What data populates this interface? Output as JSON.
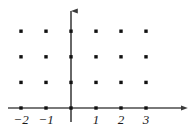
{
  "figure": {
    "title": "",
    "background_color": "#ffffff",
    "axis_color": "#4d4d4d",
    "point_color": "#111111",
    "label_color": "#1a1a1a"
  },
  "chart_data": {
    "type": "scatter",
    "title": "",
    "xlabel": "",
    "ylabel": "",
    "grid": false,
    "legend": null,
    "xlim": [
      -2.7,
      4.5
    ],
    "ylim": [
      -0.6,
      3.8
    ],
    "x_tick_labels": [
      "−2",
      "−1",
      "1",
      "2",
      "3"
    ],
    "x_tick_values": [
      -2,
      -1,
      1,
      2,
      3
    ],
    "y_tick_labels": [],
    "y_tick_values": [],
    "lattice": {
      "x_values": [
        -2,
        -1,
        0,
        1,
        2,
        3
      ],
      "y_values": [
        0,
        1,
        2,
        3
      ]
    },
    "points": [
      {
        "x": -2,
        "y": 0
      },
      {
        "x": -1,
        "y": 0
      },
      {
        "x": 0,
        "y": 0
      },
      {
        "x": 1,
        "y": 0
      },
      {
        "x": 2,
        "y": 0
      },
      {
        "x": 3,
        "y": 0
      },
      {
        "x": -2,
        "y": 1
      },
      {
        "x": -1,
        "y": 1
      },
      {
        "x": 0,
        "y": 1
      },
      {
        "x": 1,
        "y": 1
      },
      {
        "x": 2,
        "y": 1
      },
      {
        "x": 3,
        "y": 1
      },
      {
        "x": -2,
        "y": 2
      },
      {
        "x": -1,
        "y": 2
      },
      {
        "x": 0,
        "y": 2
      },
      {
        "x": 1,
        "y": 2
      },
      {
        "x": 2,
        "y": 2
      },
      {
        "x": 3,
        "y": 2
      },
      {
        "x": -2,
        "y": 3
      },
      {
        "x": -1,
        "y": 3
      },
      {
        "x": 0,
        "y": 3
      },
      {
        "x": 1,
        "y": 3
      },
      {
        "x": 2,
        "y": 3
      },
      {
        "x": 3,
        "y": 3
      }
    ],
    "point_count": 24,
    "axes": {
      "x_axis": {
        "arrow": "right",
        "start_x": -2.5,
        "end_x": 4.45
      },
      "y_axis": {
        "arrow": "up",
        "start_y": -0.55,
        "end_y": 3.75
      }
    }
  },
  "tick_labels": [
    {
      "text": "−2",
      "x": -2
    },
    {
      "text": "−1",
      "x": -1
    },
    {
      "text": "1",
      "x": 1
    },
    {
      "text": "2",
      "x": 2
    },
    {
      "text": "3",
      "x": 3
    }
  ]
}
